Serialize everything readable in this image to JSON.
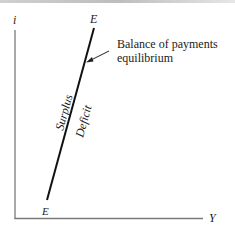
{
  "diagram": {
    "title": "",
    "axes": {
      "y_label": "i",
      "x_label": "Y"
    },
    "curve": {
      "name": "EE",
      "top_label": "E",
      "bottom_label": "E"
    },
    "annotation": {
      "line1": "Balance of payments",
      "line2": "equilibrium"
    },
    "regions": {
      "left": "Surplus",
      "right": "Deficit"
    },
    "colors": {
      "axis": "#7a7a7a",
      "curve": "#111111",
      "text": "#222222"
    }
  }
}
